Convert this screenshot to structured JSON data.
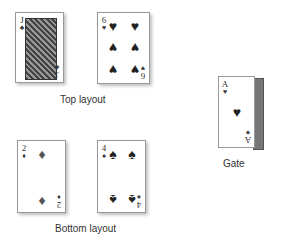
{
  "layouts": {
    "top": {
      "label": "Top layout",
      "cards": [
        {
          "rank": "J",
          "suit": "♣",
          "name": "Jack of Clubs"
        },
        {
          "rank": "6",
          "suit": "♥",
          "name": "Six of Hearts"
        }
      ]
    },
    "bottom": {
      "label": "Bottom layout",
      "cards": [
        {
          "rank": "2",
          "suit": "♦",
          "name": "Two of Diamonds"
        },
        {
          "rank": "4",
          "suit": "♠",
          "name": "Four of Spades"
        }
      ]
    },
    "gate": {
      "label": "Gate",
      "card": {
        "rank": "A",
        "suit": "♥",
        "name": "Ace of Hearts"
      }
    }
  }
}
